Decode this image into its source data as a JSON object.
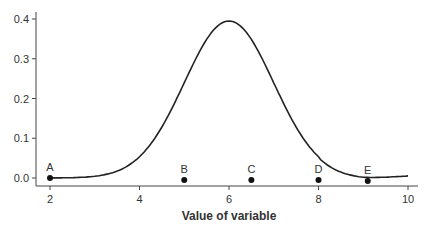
{
  "chart_data": {
    "type": "line",
    "title": "",
    "xlabel": "Value of variable",
    "ylabel": "",
    "xlim": [
      2,
      10
    ],
    "ylim": [
      0.0,
      0.4
    ],
    "x_ticks": [
      "2",
      "4",
      "6",
      "8",
      "10"
    ],
    "y_ticks": [
      "0.0",
      "0.1",
      "0.2",
      "0.3",
      "0.4"
    ],
    "grid": false,
    "legend": null,
    "series": [
      {
        "name": "density",
        "distribution": "normal",
        "mean": 6,
        "sd": 1,
        "peak": 0.395
      }
    ],
    "points": [
      {
        "label": "A",
        "x": 2,
        "y": 0.0
      },
      {
        "label": "B",
        "x": 5,
        "y": 0.0
      },
      {
        "label": "C",
        "x": 6.5,
        "y": 0.0
      },
      {
        "label": "D",
        "x": 8,
        "y": 0.0
      },
      {
        "label": "E",
        "x": 9.1,
        "y": 0.0
      }
    ]
  }
}
